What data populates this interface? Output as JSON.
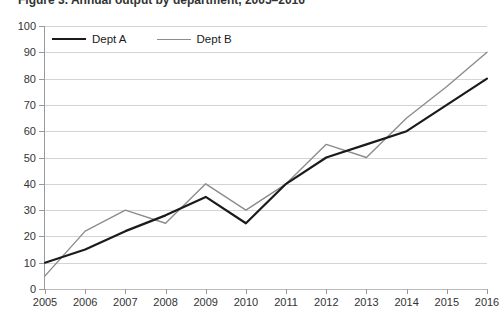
{
  "title": {
    "text": "Figure 3. Annual output by department, 2005–2016",
    "clipped": true
  },
  "legend": {
    "position": "top-left-inside",
    "entries": [
      {
        "label": "Dept A",
        "color": "#1b1b1b",
        "swatch": "line-swatch",
        "width": 2.2
      },
      {
        "label": "Dept B",
        "color": "#8c8c8c",
        "swatch": "line-swatch",
        "width": 1.4
      }
    ]
  },
  "axes": {
    "y": {
      "ticks": [
        "0",
        "10",
        "20",
        "30",
        "40",
        "50",
        "60",
        "70",
        "80",
        "90",
        "100"
      ],
      "min": 0,
      "max": 100,
      "step": 10
    },
    "x": {
      "ticks": [
        "2005",
        "2006",
        "2007",
        "2008",
        "2009",
        "2010",
        "2011",
        "2012",
        "2013",
        "2014",
        "2015",
        "2016"
      ]
    }
  },
  "colors": {
    "dept_a": "#1b1b1b",
    "dept_b": "#8c8c8c",
    "gridline": "#d4d4d4",
    "axis": "#9a9a9a",
    "background": "#ffffff",
    "text": "#333333"
  },
  "chart_data": {
    "type": "line",
    "title": "Figure 3. Annual output by department, 2005–2016",
    "xlabel": "",
    "ylabel": "",
    "ylim": [
      0,
      100
    ],
    "ytick_step": 10,
    "grid": "horizontal",
    "legend_position": "upper left",
    "categories": [
      "2005",
      "2006",
      "2007",
      "2008",
      "2009",
      "2010",
      "2011",
      "2012",
      "2013",
      "2014",
      "2015",
      "2016"
    ],
    "series": [
      {
        "name": "Dept A",
        "color": "#1b1b1b",
        "values": [
          10,
          15,
          22,
          28,
          35,
          25,
          40,
          50,
          55,
          60,
          70,
          80
        ]
      },
      {
        "name": "Dept B",
        "color": "#8c8c8c",
        "values": [
          5,
          22,
          30,
          25,
          40,
          30,
          40,
          55,
          50,
          65,
          77,
          90
        ]
      }
    ]
  }
}
